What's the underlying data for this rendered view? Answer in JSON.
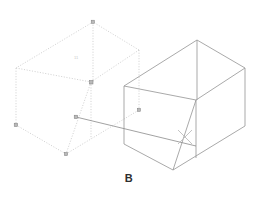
{
  "figure": {
    "caption": "B",
    "background_color": "#ffffff"
  },
  "drawing": {
    "type": "isometric-cad-viewport",
    "selected_object_label": "ghost-box",
    "solid_object_label": "box",
    "dimension_text": "11",
    "colors": {
      "ghost_line": "#c8c8c8",
      "solid_line": "#9a9a9a",
      "grip": "#8f8f8f",
      "leader": "#7d7d7d",
      "cursor": "#bdbdbd",
      "caption": "#2e2e2e"
    },
    "ghost_box": {
      "name": "dashed-preview-box",
      "style": "dashed",
      "vertices": {
        "top_back": [
          93,
          22
        ],
        "top_left": [
          16,
          68
        ],
        "top_front": [
          91,
          82
        ],
        "top_right": [
          139,
          50
        ],
        "bot_left": [
          16,
          125
        ],
        "bot_front": [
          66,
          154
        ],
        "bot_right": [
          139,
          110
        ]
      }
    },
    "solid_box": {
      "name": "solid-box",
      "style": "solid",
      "vertices": {
        "top_back": [
          197,
          40
        ],
        "top_left": [
          124,
          86
        ],
        "top_front": [
          196,
          100
        ],
        "top_right": [
          245,
          68
        ],
        "bot_left": [
          124,
          144
        ],
        "bot_front": [
          173,
          170
        ],
        "bot_right": [
          245,
          126
        ]
      }
    },
    "leader_line": {
      "name": "leader-line",
      "from": [
        76,
        117
      ],
      "to": [
        196,
        146
      ]
    },
    "cursor": {
      "name": "x-cursor",
      "center": [
        185,
        137
      ],
      "size": 14
    },
    "grips": [
      {
        "name": "grip-top-back",
        "x": 93,
        "y": 22
      },
      {
        "name": "grip-top-front",
        "x": 91,
        "y": 82
      },
      {
        "name": "grip-bot-left",
        "x": 16,
        "y": 125
      },
      {
        "name": "grip-bot-front",
        "x": 66,
        "y": 154
      },
      {
        "name": "grip-bot-right",
        "x": 139,
        "y": 110
      },
      {
        "name": "grip-leader-base",
        "x": 76,
        "y": 117
      }
    ]
  }
}
